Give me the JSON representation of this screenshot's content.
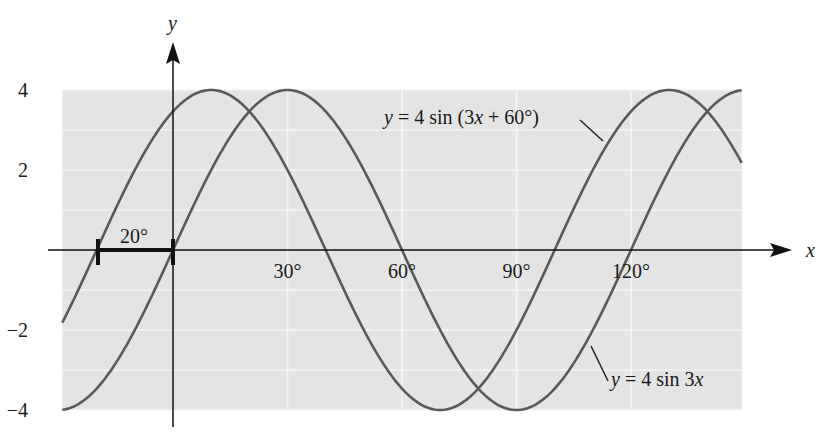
{
  "chart_data": {
    "type": "line",
    "title": "",
    "xlabel": "x",
    "ylabel": "y",
    "xlim": [
      -29,
      149
    ],
    "ylim": [
      -4,
      4
    ],
    "x_unit": "degrees",
    "grid": true,
    "x_ticks": [
      {
        "value": 30,
        "label": "30°"
      },
      {
        "value": 60,
        "label": "60°"
      },
      {
        "value": 90,
        "label": "90°"
      },
      {
        "value": 120,
        "label": "120°"
      }
    ],
    "y_ticks": [
      {
        "value": 4,
        "label": "4"
      },
      {
        "value": 2,
        "label": "2"
      },
      {
        "value": -2,
        "label": "−2"
      },
      {
        "value": -4,
        "label": "−4"
      }
    ],
    "series": [
      {
        "name": "y = 4 sin 3x",
        "amplitude": 4,
        "frequency": 3,
        "phase_deg": 0,
        "x": [
          -29,
          -20,
          -10,
          0,
          10,
          20,
          30,
          40,
          50,
          60,
          70,
          80,
          90,
          100,
          110,
          120,
          130,
          140,
          149
        ],
        "values": [
          -3.99,
          -3.46,
          -2.0,
          0.0,
          2.0,
          3.46,
          4.0,
          3.46,
          2.0,
          0.0,
          -2.0,
          -3.46,
          -4.0,
          -3.46,
          -2.0,
          0.0,
          2.0,
          3.46,
          3.99
        ]
      },
      {
        "name": "y = 4 sin (3x + 60°)",
        "amplitude": 4,
        "frequency": 3,
        "phase_deg": 60,
        "x": [
          -29,
          -20,
          -10,
          0,
          10,
          20,
          30,
          40,
          50,
          60,
          70,
          80,
          90,
          100,
          110,
          120,
          130,
          140,
          149
        ],
        "values": [
          -1.82,
          0.0,
          2.0,
          3.46,
          4.0,
          3.46,
          2.0,
          0.0,
          -2.0,
          -3.46,
          -4.0,
          -3.46,
          -2.0,
          0.0,
          2.0,
          3.46,
          4.0,
          3.46,
          2.18
        ]
      }
    ],
    "annotations": [
      {
        "text": "y = 4 sin (3x + 60°)",
        "target": "shifted curve"
      },
      {
        "text": "y = 4 sin 3x",
        "target": "base curve"
      },
      {
        "text": "20°",
        "note": "phase shift bracket from -20° to 0°"
      }
    ],
    "legend": "none (inline labels)"
  },
  "labels": {
    "axis_x": "x",
    "axis_y": "y",
    "shift": "20°",
    "curve_shifted_prefix": "y",
    "curve_shifted_rest": " = 4 sin (3",
    "curve_shifted_x": "x",
    "curve_shifted_tail": " + 60°)",
    "curve_base_prefix": "y",
    "curve_base_rest": " = 4 sin 3",
    "curve_base_x": "x"
  },
  "colors": {
    "plot_bg": "#e4e4e4",
    "grid": "#f4f4f4",
    "curve": "#5a5a5a",
    "axis": "#111111"
  }
}
